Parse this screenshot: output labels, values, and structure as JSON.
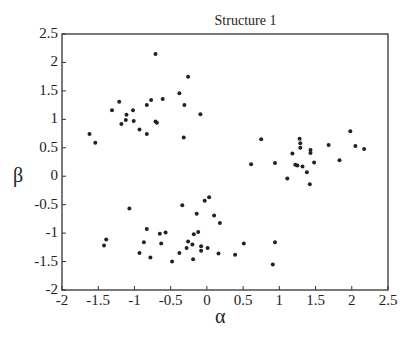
{
  "chart_data": {
    "type": "scatter",
    "title": "Structure 1",
    "xlabel": "α",
    "ylabel": "β",
    "xlim": [
      -2,
      2.5
    ],
    "ylim": [
      -2,
      2.5
    ],
    "xticks": [
      "-2",
      "-1.5",
      "-1",
      "-0.5",
      "0",
      "0.5",
      "1",
      "1.5",
      "2",
      "2.5"
    ],
    "yticks": [
      "2.5",
      "2",
      "1.5",
      "1",
      "0.5",
      "0",
      "-0.5",
      "-1",
      "-1.5",
      "-2"
    ],
    "grid": false,
    "legend": null,
    "marker_color": "#222222",
    "series": [
      {
        "name": "points",
        "points": [
          [
            -0.71,
            2.15
          ],
          [
            -0.26,
            1.75
          ],
          [
            -0.38,
            1.46
          ],
          [
            -0.61,
            1.36
          ],
          [
            -0.77,
            1.34
          ],
          [
            -0.83,
            1.25
          ],
          [
            -1.21,
            1.31
          ],
          [
            -1.31,
            1.16
          ],
          [
            -1.02,
            1.16
          ],
          [
            -0.31,
            1.25
          ],
          [
            -0.09,
            1.09
          ],
          [
            -1.11,
            1.08
          ],
          [
            -1.12,
            0.99
          ],
          [
            -1.01,
            0.97
          ],
          [
            -1.18,
            0.92
          ],
          [
            -0.71,
            0.96
          ],
          [
            -0.69,
            0.94
          ],
          [
            -0.93,
            0.82
          ],
          [
            -0.83,
            0.74
          ],
          [
            -0.32,
            0.68
          ],
          [
            -1.62,
            0.74
          ],
          [
            -1.54,
            0.59
          ],
          [
            -1.07,
            -0.57
          ],
          [
            -0.34,
            -0.51
          ],
          [
            -0.03,
            -0.43
          ],
          [
            0.03,
            -0.37
          ],
          [
            -0.14,
            -0.66
          ],
          [
            0.1,
            -0.69
          ],
          [
            0.18,
            -0.82
          ],
          [
            -0.83,
            -0.93
          ],
          [
            -0.65,
            -1.01
          ],
          [
            -0.57,
            -0.99
          ],
          [
            -0.18,
            -1.02
          ],
          [
            -0.12,
            -0.98
          ],
          [
            -1.39,
            -1.11
          ],
          [
            -1.42,
            -1.22
          ],
          [
            -0.87,
            -1.16
          ],
          [
            -0.63,
            -1.18
          ],
          [
            -0.26,
            -1.15
          ],
          [
            -0.2,
            -1.2
          ],
          [
            -0.28,
            -1.26
          ],
          [
            -0.08,
            -1.23
          ],
          [
            -0.08,
            -1.31
          ],
          [
            0.01,
            -1.26
          ],
          [
            0.16,
            -1.36
          ],
          [
            -0.93,
            -1.35
          ],
          [
            -0.38,
            -1.35
          ],
          [
            -0.78,
            -1.43
          ],
          [
            -0.48,
            -1.5
          ],
          [
            -0.19,
            -1.46
          ],
          [
            0.51,
            -1.18
          ],
          [
            0.94,
            -1.16
          ],
          [
            0.39,
            -1.38
          ],
          [
            0.91,
            -1.55
          ],
          [
            1.98,
            0.79
          ],
          [
            0.75,
            0.65
          ],
          [
            1.28,
            0.66
          ],
          [
            1.29,
            0.58
          ],
          [
            1.29,
            0.5
          ],
          [
            1.68,
            0.55
          ],
          [
            2.05,
            0.53
          ],
          [
            2.17,
            0.48
          ],
          [
            1.43,
            0.46
          ],
          [
            1.43,
            0.41
          ],
          [
            1.18,
            0.4
          ],
          [
            1.83,
            0.28
          ],
          [
            0.61,
            0.21
          ],
          [
            0.94,
            0.23
          ],
          [
            1.48,
            0.24
          ],
          [
            1.22,
            0.2
          ],
          [
            1.25,
            0.19
          ],
          [
            1.32,
            0.17
          ],
          [
            1.38,
            0.07
          ],
          [
            1.11,
            -0.04
          ],
          [
            1.42,
            -0.14
          ]
        ]
      }
    ]
  }
}
